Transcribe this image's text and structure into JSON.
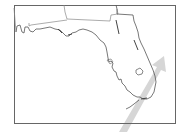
{
  "map": {
    "region": "Florida",
    "colors": {
      "background": "#ffffff",
      "frame": "#666666",
      "coastline": "#555555",
      "state_border": "#777777",
      "arrow": "#d4d4d4"
    },
    "features": [
      "state-outline",
      "neighboring-state-borders",
      "lake-okeechobee",
      "direction-arrow"
    ],
    "arrow": {
      "direction": "northeast",
      "label": ""
    }
  }
}
